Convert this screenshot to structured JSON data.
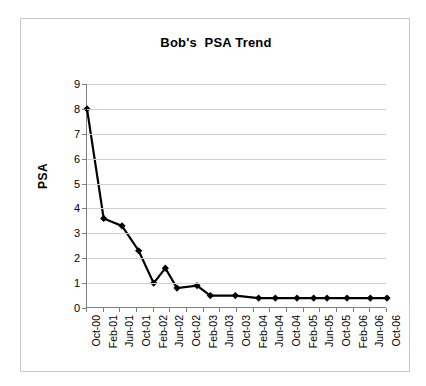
{
  "chart_data": {
    "type": "line",
    "title": "Bob's  PSA Trend",
    "xlabel": "",
    "ylabel": "PSA",
    "ylim": [
      0,
      9
    ],
    "ytick_step": 1,
    "yticks": [
      0,
      1,
      2,
      3,
      4,
      5,
      6,
      7,
      8,
      9
    ],
    "grid": true,
    "grid_axis": "y",
    "legend": false,
    "marker": "diamond",
    "line_color": "#000000",
    "marker_color": "#000000",
    "categories": [
      "Oct-00",
      "Feb-01",
      "Jun-01",
      "Oct-01",
      "Feb-02",
      "Jun-02",
      "Oct-02",
      "Feb-03",
      "Jun-03",
      "Oct-03",
      "Feb-04",
      "Jun-04",
      "Oct-04",
      "Feb-05",
      "Jun-05",
      "Oct-05",
      "Feb-06",
      "Jun-06",
      "Oct-06"
    ],
    "x": [
      "Oct-00",
      "Feb-01",
      "Jun-01",
      "Oct-01",
      "Feb-02",
      "Apr-02",
      "Jun-02",
      "Oct-02",
      "Feb-03",
      "Jun-03",
      "Aug-03",
      "Feb-04",
      "Jun-04",
      "Oct-04",
      "Feb-05",
      "Jun-05",
      "Oct-05",
      "Feb-06",
      "Oct-06"
    ],
    "values": [
      8.0,
      3.6,
      3.3,
      2.3,
      1.0,
      1.6,
      0.8,
      0.9,
      0.5,
      0.5,
      0.5,
      0.4,
      0.4,
      0.4,
      0.4,
      0.4,
      0.4,
      0.4,
      0.4
    ],
    "series": [
      {
        "name": "PSA",
        "points": [
          {
            "x": "Oct-00",
            "x_index": 0.0,
            "y": 8.0
          },
          {
            "x": "Feb-01",
            "x_index": 1.0,
            "y": 3.6
          },
          {
            "x": "Oct-01",
            "x_index": 2.1,
            "y": 3.3
          },
          {
            "x": "Feb-02",
            "x_index": 3.1,
            "y": 2.3
          },
          {
            "x": "Jun-02",
            "x_index": 4.0,
            "y": 1.0
          },
          {
            "x": "Aug-02",
            "x_index": 4.7,
            "y": 1.6
          },
          {
            "x": "Oct-02",
            "x_index": 5.4,
            "y": 0.8
          },
          {
            "x": "Feb-03",
            "x_index": 6.6,
            "y": 0.9
          },
          {
            "x": "Jun-03",
            "x_index": 7.4,
            "y": 0.5
          },
          {
            "x": "Oct-03",
            "x_index": 8.9,
            "y": 0.5
          },
          {
            "x": "Feb-04",
            "x_index": 10.3,
            "y": 0.4
          },
          {
            "x": "Jun-04",
            "x_index": 11.3,
            "y": 0.4
          },
          {
            "x": "Oct-04",
            "x_index": 12.6,
            "y": 0.4
          },
          {
            "x": "Feb-05",
            "x_index": 13.6,
            "y": 0.4
          },
          {
            "x": "Jun-05",
            "x_index": 14.4,
            "y": 0.4
          },
          {
            "x": "Oct-05",
            "x_index": 15.6,
            "y": 0.4
          },
          {
            "x": "Feb-06",
            "x_index": 17.0,
            "y": 0.4
          },
          {
            "x": "Oct-06",
            "x_index": 18.0,
            "y": 0.4
          }
        ]
      }
    ]
  }
}
